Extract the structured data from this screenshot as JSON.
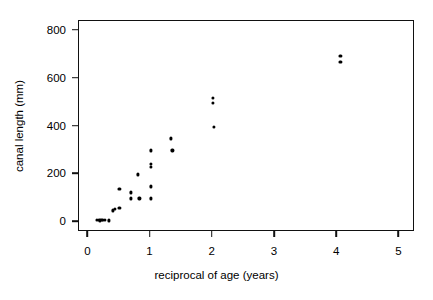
{
  "chart_data": {
    "type": "scatter",
    "title": "",
    "xlabel": "reciprocal of age (years)",
    "ylabel": "canal length (mm)",
    "xlim": [
      -0.15,
      5.25
    ],
    "ylim": [
      -40,
      840
    ],
    "xticks": [
      0,
      1,
      2,
      3,
      4,
      5
    ],
    "xticklabels": [
      "0",
      "1",
      "2",
      "3",
      "4",
      "5"
    ],
    "yticks": [
      0,
      200,
      400,
      600,
      800
    ],
    "yticklabels": [
      "0",
      "200",
      "400",
      "600",
      "800"
    ],
    "grid": false,
    "legend": null,
    "marker": "filled-circle",
    "marker_color": "#000000",
    "points": [
      {
        "x": 0.14,
        "y": 12
      },
      {
        "x": 0.17,
        "y": 10
      },
      {
        "x": 0.19,
        "y": 8
      },
      {
        "x": 0.21,
        "y": 11
      },
      {
        "x": 0.23,
        "y": 9
      },
      {
        "x": 0.26,
        "y": 10
      },
      {
        "x": 0.33,
        "y": 8
      },
      {
        "x": 0.4,
        "y": 50
      },
      {
        "x": 0.43,
        "y": 58
      },
      {
        "x": 0.5,
        "y": 60
      },
      {
        "x": 0.5,
        "y": 140
      },
      {
        "x": 0.68,
        "y": 125
      },
      {
        "x": 0.68,
        "y": 100
      },
      {
        "x": 0.8,
        "y": 200
      },
      {
        "x": 0.82,
        "y": 100
      },
      {
        "x": 1.0,
        "y": 300
      },
      {
        "x": 1.0,
        "y": 245
      },
      {
        "x": 1.0,
        "y": 230
      },
      {
        "x": 1.0,
        "y": 150
      },
      {
        "x": 1.0,
        "y": 100
      },
      {
        "x": 1.33,
        "y": 350
      },
      {
        "x": 1.35,
        "y": 300
      },
      {
        "x": 2.0,
        "y": 520
      },
      {
        "x": 2.0,
        "y": 500
      },
      {
        "x": 2.02,
        "y": 400
      },
      {
        "x": 4.05,
        "y": 695
      },
      {
        "x": 4.05,
        "y": 670
      }
    ]
  }
}
